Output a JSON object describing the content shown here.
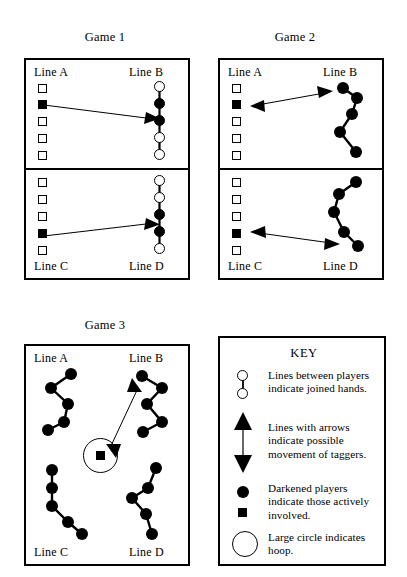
{
  "games": [
    {
      "title": "Game 1",
      "panels": [
        {
          "left_label": "Line A",
          "right_label": "Line B",
          "left_tokens": [
            "open",
            "filled",
            "open",
            "open",
            "open"
          ],
          "right_tokens": [
            "open",
            "filled",
            "filled",
            "open",
            "open"
          ],
          "arrow": "single-right"
        },
        {
          "left_label": "Line C",
          "right_label": "Line D",
          "left_tokens": [
            "open",
            "open",
            "open",
            "filled",
            "open"
          ],
          "right_tokens": [
            "open",
            "open",
            "filled",
            "filled",
            "open"
          ],
          "arrow": "single-right"
        }
      ]
    },
    {
      "title": "Game 2",
      "panels": [
        {
          "left_label": "Line A",
          "right_label": "Line B",
          "left_tokens": [
            "open",
            "filled",
            "open",
            "open",
            "open"
          ],
          "right_tokens": [
            "filled",
            "filled",
            "filled",
            "filled",
            "filled"
          ],
          "arrow": "double"
        },
        {
          "left_label": "Line C",
          "right_label": "Line D",
          "left_tokens": [
            "open",
            "open",
            "open",
            "filled",
            "open"
          ],
          "right_tokens": [
            "filled",
            "filled",
            "filled",
            "filled",
            "filled"
          ],
          "arrow": "double"
        }
      ]
    },
    {
      "title": "Game 3",
      "labels": {
        "line_a": "Line A",
        "line_b": "Line B",
        "line_c": "Line C",
        "line_d": "Line D"
      },
      "hoop_player": "filled-square",
      "arrow": "double"
    }
  ],
  "key": {
    "title": "KEY",
    "entries": [
      {
        "symbol": "two-open-circles-joined",
        "line1": "Lines between players",
        "line2": "indicate joined hands."
      },
      {
        "symbol": "double-headed-arrow",
        "line1": "Lines with arrows",
        "line2": "indicate possible",
        "line3": "movement of taggers."
      },
      {
        "symbol": "filled-circle-and-square",
        "line1": "Darkened players",
        "line2": "indicate those actively",
        "line3": "involved."
      },
      {
        "symbol": "large-open-circle",
        "line1": "Large circle indicates",
        "line2": "hoop."
      }
    ]
  },
  "colors": {
    "ink": "#000000",
    "paper": "#ffffff"
  }
}
